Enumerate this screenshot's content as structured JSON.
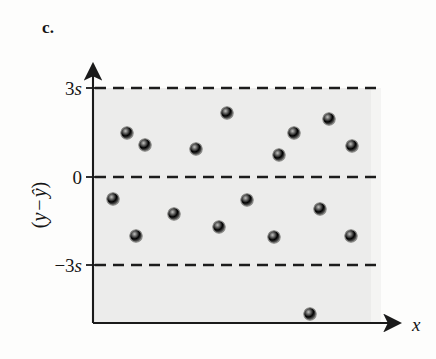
{
  "figure": {
    "panel_label": "c.",
    "background_color": "#fdfdfc",
    "band_fill_color": "#ececeb",
    "axis_color": "#1a1a1a",
    "dash_color": "#1c1c1c",
    "point_fill_color": "#a9a9a7",
    "point_stroke_color": "#8a8a88"
  },
  "axes": {
    "x_axis_label": "x",
    "y_axis_label_parts": {
      "open_paren": "(",
      "y": "y",
      "minus": "−",
      "yhat": "ŷ",
      "close_paren": ")"
    },
    "y_axis_label_text": "(y − ŷ)",
    "y_ticks": [
      {
        "label_prefix": "3",
        "label_italic": "s",
        "label": "3s",
        "value": 3,
        "y_px": 88
      },
      {
        "label_prefix": "",
        "label_italic": "",
        "label": "0",
        "value": 0,
        "y_px": 177
      },
      {
        "label_prefix": "−3",
        "label_italic": "s",
        "label": "−3s",
        "value": -3,
        "y_px": 265
      }
    ],
    "x_axis_y_px": 323,
    "y_axis_x_px": 93,
    "plot_right_px": 379,
    "band_top_px": 88,
    "band_bottom_px": 323
  },
  "chart_data": {
    "type": "scatter",
    "title": "",
    "xlabel": "x",
    "ylabel": "(y − ŷ)",
    "grid": false,
    "legend": null,
    "reference_lines": [
      {
        "label": "3s",
        "value": 3,
        "style": "dashed"
      },
      {
        "label": "0",
        "value": 0,
        "style": "dashed"
      },
      {
        "label": "-3s",
        "value": -3,
        "style": "dashed"
      }
    ],
    "ylim": [
      -5.0,
      4.0
    ],
    "xlim": [
      0,
      10
    ],
    "points_px": [
      {
        "x": 127,
        "y": 133
      },
      {
        "x": 145,
        "y": 145
      },
      {
        "x": 196,
        "y": 149
      },
      {
        "x": 227,
        "y": 113
      },
      {
        "x": 279,
        "y": 155
      },
      {
        "x": 294,
        "y": 133
      },
      {
        "x": 329,
        "y": 119
      },
      {
        "x": 352,
        "y": 146
      },
      {
        "x": 113,
        "y": 199
      },
      {
        "x": 174,
        "y": 214
      },
      {
        "x": 219,
        "y": 227
      },
      {
        "x": 247,
        "y": 200
      },
      {
        "x": 320,
        "y": 209
      },
      {
        "x": 136,
        "y": 236
      },
      {
        "x": 274,
        "y": 237
      },
      {
        "x": 351,
        "y": 236
      },
      {
        "x": 310,
        "y": 314
      }
    ],
    "points_data": [
      {
        "x": 1.2,
        "y": 1.5
      },
      {
        "x": 1.8,
        "y": 1.1
      },
      {
        "x": 3.6,
        "y": 0.95
      },
      {
        "x": 4.7,
        "y": 2.2
      },
      {
        "x": 6.5,
        "y": 0.75
      },
      {
        "x": 7.0,
        "y": 1.5
      },
      {
        "x": 8.2,
        "y": 2.0
      },
      {
        "x": 9.1,
        "y": 1.05
      },
      {
        "x": 0.7,
        "y": -0.75
      },
      {
        "x": 2.8,
        "y": -1.25
      },
      {
        "x": 4.4,
        "y": -1.7
      },
      {
        "x": 5.4,
        "y": -0.8
      },
      {
        "x": 7.9,
        "y": -1.1
      },
      {
        "x": 1.5,
        "y": -2.0
      },
      {
        "x": 6.3,
        "y": -2.0
      },
      {
        "x": 9.0,
        "y": -2.0
      },
      {
        "x": 7.6,
        "y": -4.6
      }
    ],
    "point_count": 17,
    "outlier_count": 1
  }
}
